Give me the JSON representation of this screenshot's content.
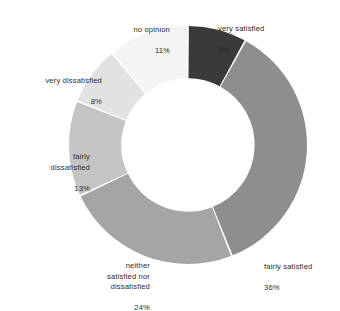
{
  "chart_data": {
    "type": "pie",
    "variant": "donut",
    "title": "",
    "subtitle": "",
    "xlabel": "",
    "ylabel": "",
    "legend_position": "none",
    "labels_position": "outside",
    "value_unit": "%",
    "start_angle_deg": 0,
    "direction": "clockwise",
    "inner_radius_ratio": 0.56,
    "categories": [
      "very satisfied",
      "fairly satisfied",
      "neither satisfied nor dissatisfied",
      "fairly dissatisfied",
      "very dissatisfied",
      "no opinion"
    ],
    "values": [
      8,
      36,
      24,
      13,
      8,
      11
    ],
    "colors": [
      "#3a3a3a",
      "#8e8e8e",
      "#a5a5a5",
      "#c4c4c4",
      "#e2e2e2",
      "#f4f4f4"
    ],
    "slices": [
      {
        "label": "very satisfied",
        "value": 8,
        "percent_text": "8%",
        "color": "#3a3a3a"
      },
      {
        "label": "fairly satisfied",
        "value": 36,
        "percent_text": "36%",
        "color": "#8e8e8e"
      },
      {
        "label": "neither satisfied nor dissatisfied",
        "value": 24,
        "percent_text": "24%",
        "color": "#a5a5a5"
      },
      {
        "label": "fairly dissatisfied",
        "value": 13,
        "percent_text": "13%",
        "color": "#c4c4c4"
      },
      {
        "label": "very dissatisfied",
        "value": 8,
        "percent_text": "8%",
        "color": "#e2e2e2"
      },
      {
        "label": "no opinion",
        "value": 11,
        "percent_text": "11%",
        "color": "#f4f4f4"
      }
    ]
  },
  "labels": {
    "very_satisfied": {
      "text": "very satisfied",
      "pct": "8%"
    },
    "fairly_satisfied": {
      "text": "fairly satisfied",
      "pct": "36%"
    },
    "neither": {
      "text": "neither\nsatisfied nor\ndissatisfied",
      "pct": "24%"
    },
    "fairly_dissatisfied": {
      "text": "fairly\ndissatisfied",
      "pct": "13%"
    },
    "very_dissatisfied": {
      "text": "very dissatisfied",
      "pct": "8%"
    },
    "no_opinion": {
      "text": "no opinion",
      "pct": "11%"
    }
  },
  "style": {
    "background": "#ffffff",
    "text_color": "#2b2b2b",
    "slice_gap_color": "#ffffff"
  }
}
